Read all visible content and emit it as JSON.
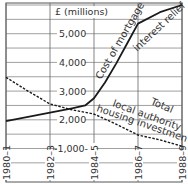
{
  "chart_data": {
    "type": "line",
    "title": "",
    "unit_label": "£ (millions)",
    "xlabel": "",
    "ylabel": "£ (millions)",
    "categories": [
      "1980–1",
      "1982–3",
      "1984–5",
      "1986–7",
      "1988–9"
    ],
    "x_positions": [
      0,
      2,
      4,
      6,
      8
    ],
    "y_ticks": [
      {
        "value": 5000,
        "label": "5,000"
      },
      {
        "value": 4000,
        "label": "4,000"
      },
      {
        "value": 3000,
        "label": "3,000"
      },
      {
        "value": 2000,
        "label": "2,000"
      },
      {
        "value": 1000,
        "label": "-1,000-"
      }
    ],
    "ylim": [
      0,
      6100
    ],
    "grid": true,
    "series": [
      {
        "name": "Cost of mortgage interest relief",
        "style": "solid",
        "x": [
          0,
          1,
          2,
          3,
          3.6,
          4,
          4.5,
          5,
          5.5,
          6,
          7,
          8
        ],
        "values": [
          1950,
          2100,
          2250,
          2400,
          2500,
          2750,
          3300,
          3950,
          4650,
          5350,
          5750,
          6000
        ]
      },
      {
        "name": "Total local authority housing investment",
        "style": "dashed",
        "x": [
          0,
          1,
          2,
          3,
          4,
          5,
          6,
          7,
          8
        ],
        "values": [
          3480,
          3000,
          2550,
          2350,
          2200,
          1850,
          1470,
          1300,
          1080
        ]
      }
    ],
    "annotations": [
      {
        "text": "Cost of mortgage",
        "series": 0
      },
      {
        "text": "interest relief",
        "series": 0
      },
      {
        "text": "Total",
        "series": 1
      },
      {
        "text": "local authority",
        "series": 1
      },
      {
        "text": "housing investment",
        "series": 1
      }
    ]
  }
}
